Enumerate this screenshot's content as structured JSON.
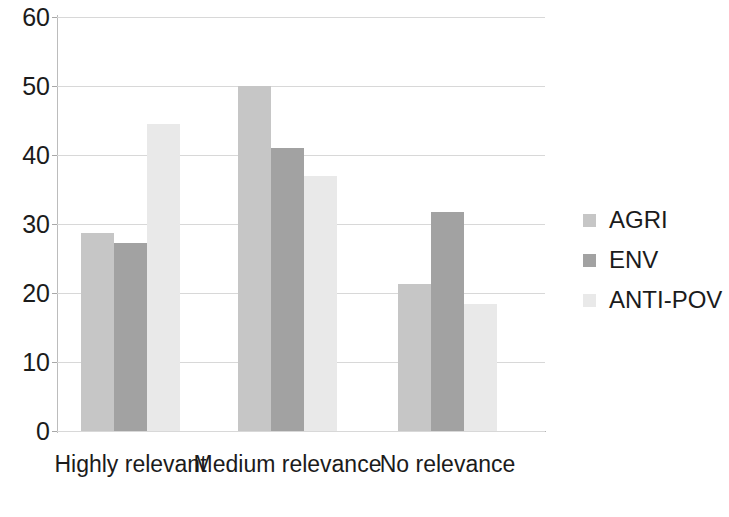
{
  "chart_data": {
    "type": "bar",
    "title": "",
    "subtitle": "",
    "xlabel": "",
    "ylabel": "",
    "categories": [
      "Highly relevant",
      "Medium relevance",
      "No relevance"
    ],
    "series": [
      {
        "name": "AGRI",
        "color": "#c6c6c6",
        "values": [
          28.7,
          50.0,
          21.3
        ]
      },
      {
        "name": "ENV",
        "color": "#a2a2a2",
        "values": [
          27.3,
          41.0,
          31.8
        ]
      },
      {
        "name": "ANTI-POV",
        "color": "#e9e9e9",
        "values": [
          44.5,
          37.0,
          18.4
        ]
      }
    ],
    "ylim": [
      0,
      60
    ],
    "y_ticks": [
      0,
      10,
      20,
      30,
      40,
      50,
      60
    ],
    "y_tick_labels": [
      "0",
      "10",
      "20",
      "30",
      "40",
      "50",
      "60"
    ],
    "grid": true,
    "grid_axis": "y",
    "legend": true,
    "legend_position": "right",
    "legend_entries": [
      "AGRI",
      "ENV",
      "ANTI-POV"
    ],
    "annotations": []
  }
}
